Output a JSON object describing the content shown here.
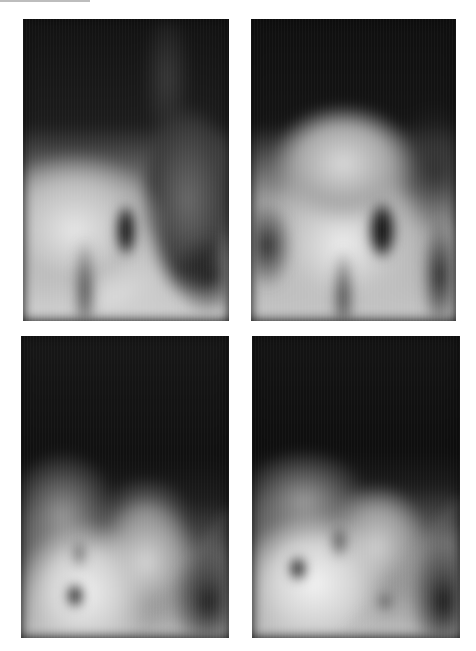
{
  "figure": {
    "layout": "2x2 grid",
    "background": "#ffffff",
    "panels": [
      {
        "id": "top-left",
        "type": "radiograph",
        "label": ""
      },
      {
        "id": "top-right",
        "type": "radiograph",
        "label": ""
      },
      {
        "id": "bottom-left",
        "type": "radiograph",
        "label": ""
      },
      {
        "id": "bottom-right",
        "type": "radiograph",
        "label": ""
      }
    ]
  }
}
